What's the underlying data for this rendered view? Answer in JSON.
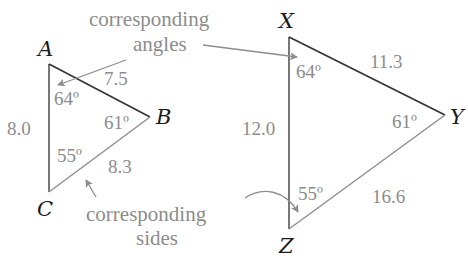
{
  "annotations": {
    "angles_line1": "corresponding",
    "angles_line2": "angles",
    "sides_line1": "corresponding",
    "sides_line2": "sides"
  },
  "triangle_small": {
    "vertices": {
      "top": "A",
      "right": "B",
      "bottom": "C"
    },
    "angles": {
      "A": "64º",
      "B": "61º",
      "C": "55º"
    },
    "sides": {
      "AB": "7.5",
      "AC": "8.0",
      "BC": "8.3"
    }
  },
  "triangle_large": {
    "vertices": {
      "top": "X",
      "right": "Y",
      "bottom": "Z"
    },
    "angles": {
      "X": "64º",
      "Y": "61º",
      "Z": "55º"
    },
    "sides": {
      "XY": "11.3",
      "XZ": "12.0",
      "YZ": "16.6"
    }
  },
  "colors": {
    "triangle_edge_dark": "#333333",
    "triangle_edge_light": "#8c8c8c",
    "label_gray": "#8c8c8c",
    "vertex_label": "#1a1a1a"
  }
}
